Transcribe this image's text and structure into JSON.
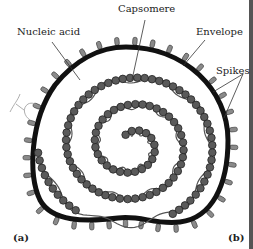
{
  "figure": {
    "labels": {
      "capsomere": "Capsomere",
      "nucleic_acid": "Nucleic acid",
      "envelope": "Envelope",
      "spikes": "Spikes"
    },
    "panels": {
      "a": "(a)",
      "b": "(b)"
    },
    "handwriting": "tc",
    "colors": {
      "envelope": "#111111",
      "capsomere_fill": "#5a5a5a",
      "capsomere_stroke": "#222222",
      "nucleic_acid": "#555555",
      "spike_fill": "#8a8a8a",
      "background": "#ffffff"
    }
  }
}
